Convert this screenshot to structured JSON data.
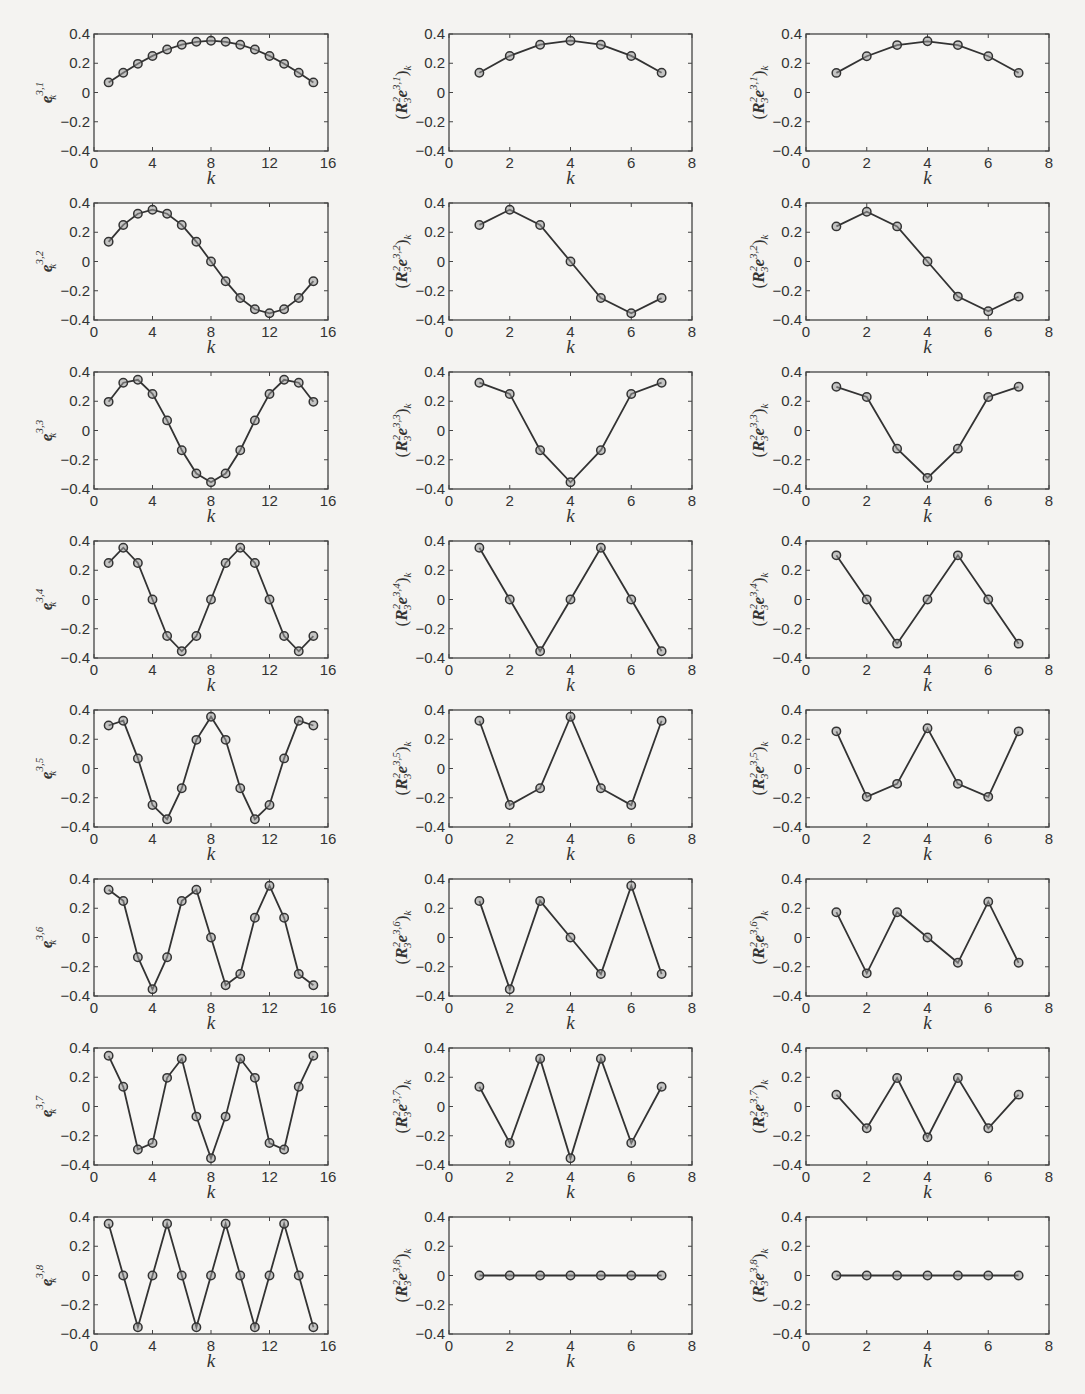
{
  "chart_data": {
    "type": "line",
    "layout": "grid of 8 rows x 3 columns",
    "common": {
      "xlabel": "k",
      "ylim": [
        -0.4,
        0.4
      ],
      "yticks": [
        0.4,
        0.2,
        0,
        -0.2,
        -0.4
      ],
      "ytick_labels": [
        "0.4",
        "0.2",
        "0",
        "−0.2",
        "−0.4"
      ],
      "marker": "circle",
      "grid": false
    },
    "columns": [
      {
        "name": "fine-grid-basis",
        "xlim": [
          0,
          16
        ],
        "xticks": [
          0,
          4,
          8,
          12,
          16
        ],
        "xtick_labels": [
          "0",
          "4",
          "8",
          "12",
          "16"
        ],
        "x": [
          1,
          2,
          3,
          4,
          5,
          6,
          7,
          8,
          9,
          10,
          11,
          12,
          13,
          14,
          15
        ],
        "ylabel_base": "e",
        "ylabel_sub": "k",
        "panels": [
          {
            "ylabel_sup": "3,1",
            "values": [
              0.069,
              0.135,
              0.196,
              0.25,
              0.294,
              0.327,
              0.347,
              0.354,
              0.347,
              0.327,
              0.294,
              0.25,
              0.196,
              0.135,
              0.069
            ]
          },
          {
            "ylabel_sup": "3,2",
            "values": [
              0.135,
              0.25,
              0.327,
              0.354,
              0.327,
              0.25,
              0.135,
              0,
              -0.135,
              -0.25,
              -0.327,
              -0.354,
              -0.327,
              -0.25,
              -0.135
            ]
          },
          {
            "ylabel_sup": "3,3",
            "values": [
              0.196,
              0.327,
              0.347,
              0.25,
              0.069,
              -0.135,
              -0.294,
              -0.354,
              -0.294,
              -0.135,
              0.069,
              0.25,
              0.347,
              0.327,
              0.196
            ]
          },
          {
            "ylabel_sup": "3,4",
            "values": [
              0.25,
              0.354,
              0.25,
              0,
              -0.25,
              -0.354,
              -0.25,
              0,
              0.25,
              0.354,
              0.25,
              0,
              -0.25,
              -0.354,
              -0.25
            ]
          },
          {
            "ylabel_sup": "3,5",
            "values": [
              0.294,
              0.327,
              0.069,
              -0.25,
              -0.347,
              -0.135,
              0.196,
              0.354,
              0.196,
              -0.135,
              -0.347,
              -0.25,
              0.069,
              0.327,
              0.294
            ]
          },
          {
            "ylabel_sup": "3,6",
            "values": [
              0.327,
              0.25,
              -0.135,
              -0.354,
              -0.135,
              0.25,
              0.327,
              0,
              -0.327,
              -0.25,
              0.135,
              0.354,
              0.135,
              -0.25,
              -0.327
            ]
          },
          {
            "ylabel_sup": "3,7",
            "values": [
              0.347,
              0.135,
              -0.294,
              -0.25,
              0.196,
              0.327,
              -0.069,
              -0.354,
              -0.069,
              0.327,
              0.196,
              -0.25,
              -0.294,
              0.135,
              0.347
            ]
          },
          {
            "ylabel_sup": "3,8",
            "values": [
              0.354,
              0,
              -0.354,
              0,
              0.354,
              0,
              -0.354,
              0,
              0.354,
              0,
              -0.354,
              0,
              0.354,
              0,
              -0.354
            ]
          }
        ]
      },
      {
        "name": "restriction-injection",
        "xlim": [
          0,
          8
        ],
        "xticks": [
          0,
          2,
          4,
          6,
          8
        ],
        "xtick_labels": [
          "0",
          "2",
          "4",
          "6",
          "8"
        ],
        "x": [
          1,
          2,
          3,
          4,
          5,
          6,
          7
        ],
        "ylabel_open": "(",
        "ylabel_op": "R",
        "ylabel_op_sup": "2",
        "ylabel_op_sub": "3",
        "ylabel_vec": "e",
        "ylabel_close": ")",
        "ylabel_sub": "k",
        "panels": [
          {
            "ylabel_sup": "3,1",
            "values": [
              0.135,
              0.25,
              0.327,
              0.354,
              0.327,
              0.25,
              0.135
            ]
          },
          {
            "ylabel_sup": "3,2",
            "values": [
              0.25,
              0.354,
              0.25,
              0,
              -0.25,
              -0.354,
              -0.25
            ]
          },
          {
            "ylabel_sup": "3,3",
            "values": [
              0.327,
              0.25,
              -0.135,
              -0.354,
              -0.135,
              0.25,
              0.327
            ]
          },
          {
            "ylabel_sup": "3,4",
            "values": [
              0.354,
              0,
              -0.354,
              0,
              0.354,
              0,
              -0.354
            ]
          },
          {
            "ylabel_sup": "3,5",
            "values": [
              0.327,
              -0.25,
              -0.135,
              0.354,
              -0.135,
              -0.25,
              0.327
            ]
          },
          {
            "ylabel_sup": "3,6",
            "values": [
              0.25,
              -0.354,
              0.25,
              0,
              -0.25,
              0.354,
              -0.25
            ]
          },
          {
            "ylabel_sup": "3,7",
            "values": [
              0.135,
              -0.25,
              0.327,
              -0.354,
              0.327,
              -0.25,
              0.135
            ]
          },
          {
            "ylabel_sup": "3,8",
            "values": [
              0,
              0,
              0,
              0,
              0,
              0,
              0
            ]
          }
        ]
      },
      {
        "name": "restriction-full-weighting",
        "xlim": [
          0,
          8
        ],
        "xticks": [
          0,
          2,
          4,
          6,
          8
        ],
        "xtick_labels": [
          "0",
          "2",
          "4",
          "6",
          "8"
        ],
        "x": [
          1,
          2,
          3,
          4,
          5,
          6,
          7
        ],
        "ylabel_open": "(",
        "ylabel_op": "R",
        "ylabel_op_sup": "2",
        "ylabel_op_sub": "3",
        "ylabel_vec": "e",
        "ylabel_close": ")",
        "ylabel_sub": "k",
        "panels": [
          {
            "ylabel_sup": "3,1",
            "values": [
              0.134,
              0.248,
              0.324,
              0.35,
              0.324,
              0.248,
              0.134
            ]
          },
          {
            "ylabel_sup": "3,2",
            "values": [
              0.24,
              0.34,
              0.24,
              0,
              -0.24,
              -0.34,
              -0.24
            ]
          },
          {
            "ylabel_sup": "3,3",
            "values": [
              0.299,
              0.229,
              -0.124,
              -0.324,
              -0.124,
              0.229,
              0.299
            ]
          },
          {
            "ylabel_sup": "3,4",
            "values": [
              0.302,
              0,
              -0.302,
              0,
              0.302,
              0,
              -0.302
            ]
          },
          {
            "ylabel_sup": "3,5",
            "values": [
              0.254,
              -0.194,
              -0.105,
              0.275,
              -0.105,
              -0.194,
              0.254
            ]
          },
          {
            "ylabel_sup": "3,6",
            "values": [
              0.173,
              -0.245,
              0.173,
              0,
              -0.173,
              0.245,
              -0.173
            ]
          },
          {
            "ylabel_sup": "3,7",
            "values": [
              0.081,
              -0.149,
              0.195,
              -0.211,
              0.195,
              -0.149,
              0.081
            ]
          },
          {
            "ylabel_sup": "3,8",
            "values": [
              0,
              0,
              0,
              0,
              0,
              0,
              0
            ]
          }
        ]
      }
    ]
  }
}
